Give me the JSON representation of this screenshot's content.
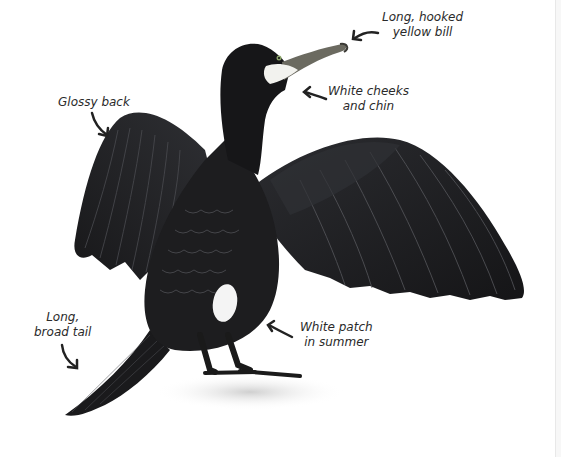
{
  "illustration": {
    "subject": "cormorant",
    "colors": {
      "plumage": "#1c1c1e",
      "plumage_highlight": "#3a3b3f",
      "feather_edge": "#55565b",
      "bill": "#6b6a60",
      "cheek": "#f2f2ee",
      "ground": "#d9d9d9",
      "background": "#ffffff"
    }
  },
  "labels": {
    "bill": {
      "line1": "Long, hooked",
      "line2": "yellow bill"
    },
    "cheeks": {
      "line1": "White cheeks",
      "line2": "and chin"
    },
    "back": {
      "line1": "Glossy back"
    },
    "tail": {
      "line1": "Long,",
      "line2": "broad tail"
    },
    "patch": {
      "line1": "White patch",
      "line2": "in summer"
    }
  }
}
